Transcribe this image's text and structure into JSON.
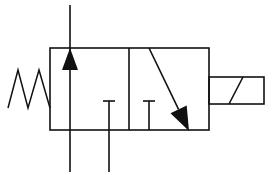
{
  "diagram": {
    "title": "3/2 way directional control valve, solenoid operated, spring return",
    "colors": {
      "stroke": "#111111",
      "background": "#ffffff"
    },
    "components": {
      "spring": {
        "label": "spring return",
        "zigzag_points": [
          [
            8,
            108
          ],
          [
            18,
            70
          ],
          [
            28,
            108
          ],
          [
            39,
            70
          ],
          [
            50,
            108
          ]
        ]
      },
      "valve_body": {
        "x": 50,
        "y": 48,
        "width": 159,
        "height": 82,
        "divider_x": 129
      },
      "left_envelope": {
        "flow_line": {
          "x": 70,
          "y1": 5,
          "y2": 172
        },
        "arrow_up": {
          "tip": [
            70,
            48
          ],
          "base_left": [
            62,
            70
          ],
          "base_right": [
            78,
            70
          ]
        },
        "blocked_port": {
          "x": 109,
          "cap_y": 101,
          "cap_half": 6,
          "stem_bottom": 172
        }
      },
      "right_envelope": {
        "blocked_port": {
          "x": 149,
          "cap_y": 101,
          "cap_half": 6,
          "stem_bottom": 130
        },
        "arrow_diagonal": {
          "from": [
            149,
            48
          ],
          "tip": [
            189,
            131
          ]
        }
      },
      "solenoid": {
        "x": 209,
        "y": 77,
        "width": 55,
        "height": 27,
        "slash": [
          [
            229,
            104
          ],
          [
            243,
            77
          ]
        ]
      }
    }
  }
}
